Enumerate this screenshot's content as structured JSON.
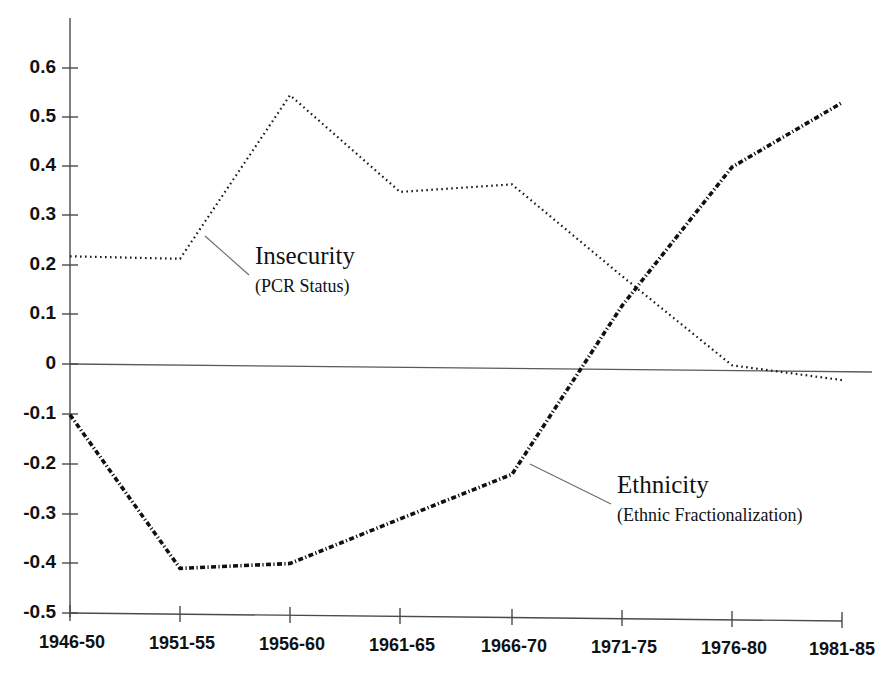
{
  "chart_data": {
    "type": "line",
    "title": "",
    "subtitle": "",
    "xlabel": "",
    "ylabel": "",
    "categories": [
      "1946-50",
      "1951-55",
      "1956-60",
      "1961-65",
      "1966-70",
      "1971-75",
      "1976-80",
      "1981-85"
    ],
    "ylim": [
      -0.5,
      0.65
    ],
    "yticks": [
      0.6,
      0.5,
      0.4,
      0.3,
      0.2,
      0.1,
      0,
      -0.1,
      -0.2,
      -0.3,
      -0.4,
      -0.5
    ],
    "ytick_labels": [
      "0.6",
      "0.5",
      "0.4",
      "0.3",
      "0.2",
      "0.1",
      "0",
      "-0.1",
      "-0.2",
      "-0.3",
      "-0.4",
      "-0.5"
    ],
    "grid": false,
    "legend_position": "inline-annotations",
    "zero_line": true,
    "series": [
      {
        "name": "Insecurity",
        "sublabel": "(PCR Status)",
        "style": "dotted",
        "values": [
          0.22,
          0.215,
          0.545,
          0.35,
          0.365,
          0.18,
          0.0,
          -0.03
        ]
      },
      {
        "name": "Ethnicity",
        "sublabel": "(Ethnic Fractionalization)",
        "style": "dash-dot",
        "values": [
          -0.1,
          -0.41,
          -0.4,
          -0.31,
          -0.22,
          0.12,
          0.4,
          0.53
        ]
      }
    ],
    "annotations": [
      {
        "label": "Insecurity",
        "sublabel": "(PCR Status)",
        "text_x": 255,
        "text_y": 264,
        "sub_x": 255,
        "sub_y": 292,
        "leader_from_x": 205,
        "leader_from_y": 236,
        "leader_to_x": 249,
        "leader_to_y": 275
      },
      {
        "label": "Ethnicity",
        "sublabel": "(Ethnic Fractionalization)",
        "text_x": 617,
        "text_y": 493,
        "sub_x": 617,
        "sub_y": 521,
        "leader_from_x": 530,
        "leader_from_y": 464,
        "leader_to_x": 611,
        "leader_to_y": 504
      }
    ]
  },
  "colors": {
    "background": "#ffffff",
    "axis": "#4a4a4a",
    "series_insecurity": "#1a1a1a",
    "series_ethnicity": "#101010",
    "text": "#111111"
  }
}
